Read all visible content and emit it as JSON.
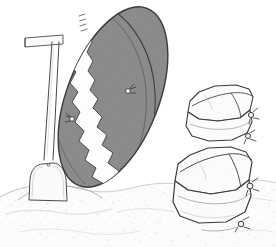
{
  "scene": {
    "title": "Line drawing of a long gray sandbag leaning on a shovel beside stacked sandbags on sand",
    "width": 276,
    "height": 247,
    "background_color": "#ffffff",
    "style": "pen-and-ink line illustration with gray tone fill"
  },
  "palette": {
    "background": "#ffffff",
    "ink_line": "#3a3a3a",
    "ink_line_soft": "#6f6f6f",
    "bag_gray_fill": "#8b8b8b",
    "bag_gray_dark": "#7a7a7a",
    "bag_white_stripe": "#fdfdfd",
    "sack_fill": "#fbfbfb",
    "sack_shade": "#ececec",
    "sand_fill": "#fcfcfc",
    "sand_stipple": "#b9b9b9",
    "shovel_fill": "#fafafa"
  },
  "objects": [
    {
      "id": "long-tube-sandbag",
      "label": "Long gray tube sandbag",
      "description": "Large elongated oval bag leaning diagonally, gray fill with a white zigzag seam stripe running down its length",
      "fill": "#8b8b8b",
      "stripe_fill": "#fdfdfd",
      "tie_count": 2
    },
    {
      "id": "shovel",
      "label": "Shovel",
      "description": "Long handled shovel with a T-grip at top, blade buried in the sand mound",
      "fill": "#fafafa",
      "grip_type": "T-handle"
    },
    {
      "id": "sandbag-stack-upper",
      "label": "Upper stacked sandbags",
      "description": "Two filled sandbags stacked, tied corner on the right side",
      "fill": "#fbfbfb",
      "tie_count": 2
    },
    {
      "id": "sandbag-stack-lower",
      "label": "Lower stacked sandbags",
      "description": "Two filled sandbags stacked, tied corners on the right side",
      "fill": "#fbfbfb",
      "tie_count": 2
    },
    {
      "id": "sand-ground",
      "label": "Sand ground",
      "description": "Mounded sandy ground with light stipple texture across the lower portion",
      "fill": "#fcfcfc"
    }
  ]
}
